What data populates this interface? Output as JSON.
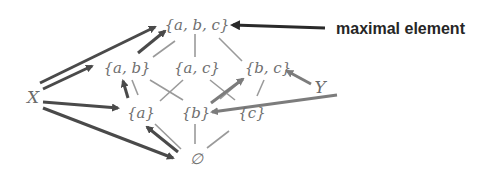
{
  "diagram": {
    "type": "hasse-diagram",
    "nodes": {
      "abc": "{a, b, c}",
      "ab": "{a, b}",
      "ac": "{a, c}",
      "bc": "{b, c}",
      "a": "{a}",
      "b": "{b}",
      "c": "{c}",
      "empty": "∅"
    },
    "edges": [
      [
        "abc",
        "ab"
      ],
      [
        "abc",
        "ac"
      ],
      [
        "abc",
        "bc"
      ],
      [
        "ab",
        "a"
      ],
      [
        "ab",
        "b"
      ],
      [
        "ac",
        "a"
      ],
      [
        "ac",
        "c"
      ],
      [
        "bc",
        "b"
      ],
      [
        "bc",
        "c"
      ],
      [
        "a",
        "empty"
      ],
      [
        "b",
        "empty"
      ],
      [
        "c",
        "empty"
      ]
    ],
    "subsets": {
      "X": {
        "label": "X",
        "points_to": [
          "abc",
          "ab",
          "a",
          "empty"
        ]
      },
      "Y": {
        "label": "Y",
        "points_to": [
          "bc",
          "b"
        ]
      }
    },
    "annotation": {
      "label": "maximal element",
      "points_to": "abc"
    },
    "colors": {
      "node_text": "#6f6f6f",
      "edges": "#9a9a9a",
      "x_arrows": "#4a4a4a",
      "y_arrows": "#7c7c7c",
      "annotation_arrow": "#2a2a2a",
      "annotation_text": "#262626"
    }
  }
}
